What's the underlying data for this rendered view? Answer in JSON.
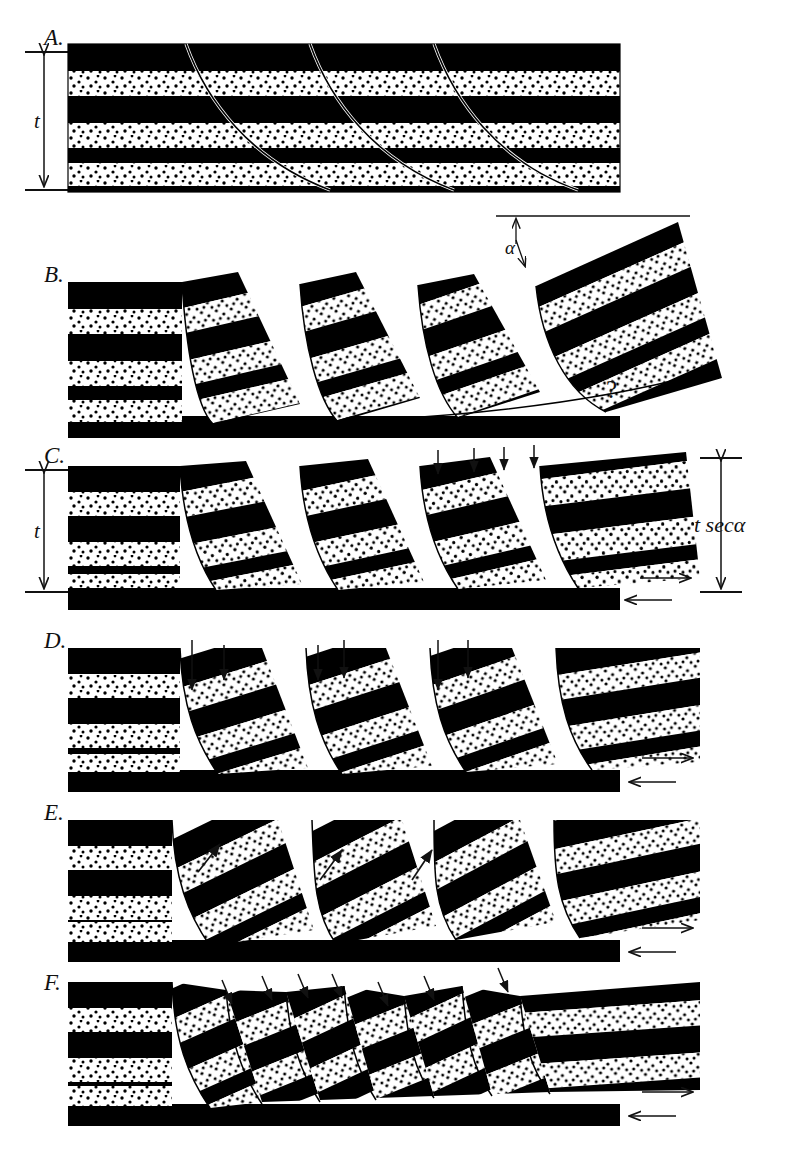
{
  "figure": {
    "width": 795,
    "height": 1168,
    "background": "#ffffff",
    "ink_color": "#000000",
    "stipple_color": "#000000",
    "stipple_background": "#ffffff"
  },
  "panels": [
    {
      "id": "A",
      "label": "A.",
      "caption": "Undeformed layered sequence cut by curved (listric) fault traces",
      "dimension_label": "t",
      "down_arrow_count": 0,
      "shear_couple": false,
      "block_rotation_deg": 0
    },
    {
      "id": "B",
      "label": "B.",
      "caption": "Rigid rotation of blocks on listric faults leaves a void (?) at depth",
      "angle_label": "α",
      "query_label": "?",
      "down_arrow_count": 0,
      "shear_couple": false,
      "block_rotation_deg": 22
    },
    {
      "id": "C",
      "label": "C.",
      "caption": "Vertical thinning accommodates the rotation; thickness becomes t sec α",
      "dimension_label": "t",
      "dimension_label_right": "t secα",
      "down_arrow_count": 4,
      "shear_couple": true,
      "block_rotation_deg": 14
    },
    {
      "id": "D",
      "label": "D.",
      "caption": "Continued vertical collapse of the hanging-wall blocks",
      "down_arrow_count": 6,
      "shear_couple": true,
      "block_rotation_deg": 24
    },
    {
      "id": "E",
      "label": "E.",
      "caption": "Reverse-drag / upward shear along the fault surfaces",
      "up_arrow_count": 3,
      "shear_couple": true,
      "block_rotation_deg": 34
    },
    {
      "id": "F",
      "label": "F.",
      "caption": "Antithetic faulting breaks the rotated blocks into smaller slices",
      "down_arrow_count": 7,
      "shear_couple": true,
      "block_rotation_deg": 30
    }
  ],
  "annotations": {
    "thickness": "t",
    "thickness_rotated": "t secα",
    "angle": "α",
    "unknown": "?"
  },
  "legend": {
    "dark_layer_name": "shale-marker-bed",
    "stipple_layer_name": "sandstone-bed",
    "fault_trace_name": "listric-fault-trace"
  },
  "stratigraphy": {
    "layer_order": [
      "dark",
      "stipple",
      "dark",
      "stipple",
      "dark",
      "stipple",
      "dark"
    ],
    "layer_count": 7,
    "unit_thickness_px": 25
  }
}
